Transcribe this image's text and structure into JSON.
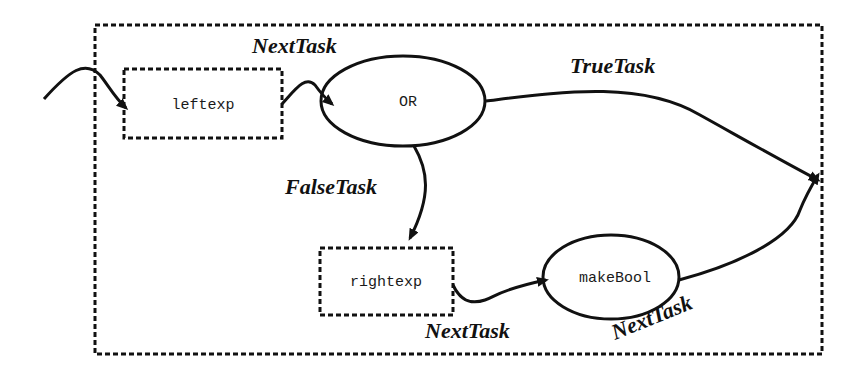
{
  "diagram": {
    "container": {
      "style": "dashed"
    },
    "nodes": {
      "leftexp": {
        "label": "leftexp",
        "shape": "dashed-rect"
      },
      "or": {
        "label": "OR",
        "shape": "ellipse"
      },
      "rightexp": {
        "label": "rightexp",
        "shape": "dashed-rect"
      },
      "makebool": {
        "label": "makeBool",
        "shape": "ellipse"
      }
    },
    "edges": {
      "entry_to_leftexp": {
        "label": ""
      },
      "leftexp_to_or": {
        "label": "NextTask"
      },
      "or_true": {
        "label": "TrueTask"
      },
      "or_false": {
        "label": "FalseTask"
      },
      "rightexp_to_makebool": {
        "label": "NextTask"
      },
      "makebool_out": {
        "label": "NextTask"
      }
    }
  }
}
